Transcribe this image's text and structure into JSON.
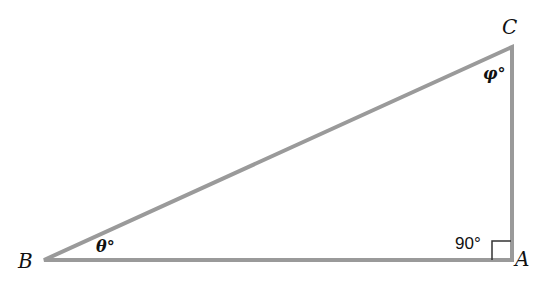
{
  "diagram": {
    "type": "right-triangle",
    "colors": {
      "side": "#9a9a9a",
      "text": "#111111",
      "right_angle_marker": "#333333"
    },
    "vertices": {
      "A": {
        "label": "A",
        "x": 512,
        "y": 260
      },
      "B": {
        "label": "B",
        "x": 44,
        "y": 260
      },
      "C": {
        "label": "C",
        "x": 512,
        "y": 47
      }
    },
    "angles": {
      "B": {
        "label": "θ°"
      },
      "C": {
        "label": "φ°"
      },
      "A": {
        "label": "90°"
      }
    }
  }
}
